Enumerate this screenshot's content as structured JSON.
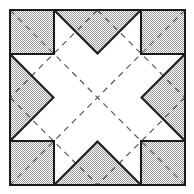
{
  "diagram": {
    "title": "",
    "kind": "origami-fold-pattern",
    "canvas": {
      "width": 194,
      "height": 194
    },
    "colors": {
      "background": "#ffffff",
      "shade_dark": "#9a9a9a",
      "shade_light": "#ffffff",
      "outline": "#1a1a1a",
      "dashed": "#555555"
    },
    "outer_square": {
      "x": 10,
      "y": 10,
      "size": 175
    },
    "corner_squares": [
      {
        "name": "corner-square-top-left",
        "x": 10,
        "y": 10,
        "size": 44
      },
      {
        "name": "corner-square-top-right",
        "x": 141,
        "y": 10,
        "size": 44
      },
      {
        "name": "corner-square-bottom-left",
        "x": 10,
        "y": 141,
        "size": 44
      },
      {
        "name": "corner-square-bottom-right",
        "x": 141,
        "y": 141,
        "size": 44
      }
    ],
    "edge_triangles": [
      {
        "name": "edge-triangle-top",
        "points": "54,10 141,10 97.5,53.5"
      },
      {
        "name": "edge-triangle-bottom",
        "points": "54,185 141,185 97.5,141.5"
      },
      {
        "name": "edge-triangle-left",
        "points": "10,54 10,141 53.5,97.5"
      },
      {
        "name": "edge-triangle-right",
        "points": "185,54 185,141 141.5,97.5"
      }
    ],
    "dashed_lines": [
      {
        "name": "dashed-diagonal-main",
        "x1": 10,
        "y1": 10,
        "x2": 185,
        "y2": 185
      },
      {
        "name": "dashed-diagonal-anti",
        "x1": 185,
        "y1": 10,
        "x2": 10,
        "y2": 185
      },
      {
        "name": "dashed-diamond-top-left",
        "x1": 97.5,
        "y1": 10,
        "x2": 10,
        "y2": 97.5
      },
      {
        "name": "dashed-diamond-top-right",
        "x1": 97.5,
        "y1": 10,
        "x2": 185,
        "y2": 97.5
      },
      {
        "name": "dashed-diamond-bottom-left",
        "x1": 10,
        "y1": 97.5,
        "x2": 97.5,
        "y2": 185
      },
      {
        "name": "dashed-diamond-bottom-right",
        "x1": 185,
        "y1": 97.5,
        "x2": 97.5,
        "y2": 185
      }
    ]
  }
}
